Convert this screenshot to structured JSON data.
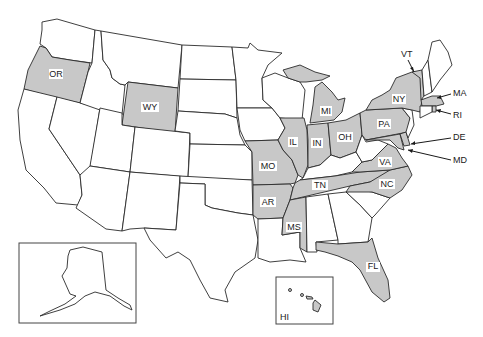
{
  "map": {
    "title": "United States",
    "highlight_color": "#c8c8c8",
    "base_color": "#ffffff",
    "border_color": "#2a2a2a",
    "highlighted_states": [
      "OR",
      "WY",
      "MO",
      "AR",
      "IL",
      "IN",
      "MI",
      "OH",
      "PA",
      "NY",
      "VT",
      "MA",
      "RI",
      "DE",
      "MD",
      "VA",
      "TN",
      "NC",
      "MS",
      "FL",
      "HI"
    ],
    "labels": {
      "OR": "OR",
      "WY": "WY",
      "MO": "MO",
      "AR": "AR",
      "IL": "IL",
      "IN": "IN",
      "MI": "MI",
      "OH": "OH",
      "PA": "PA",
      "NY": "NY",
      "VA": "VA",
      "TN": "TN",
      "NC": "NC",
      "MS": "MS",
      "FL": "FL",
      "HI": "HI"
    },
    "callouts": {
      "VT": "VT",
      "MA": "MA",
      "RI": "RI",
      "DE": "DE",
      "MD": "MD"
    },
    "insets": {
      "alaska": "Alaska",
      "hawaii": "HI"
    }
  }
}
